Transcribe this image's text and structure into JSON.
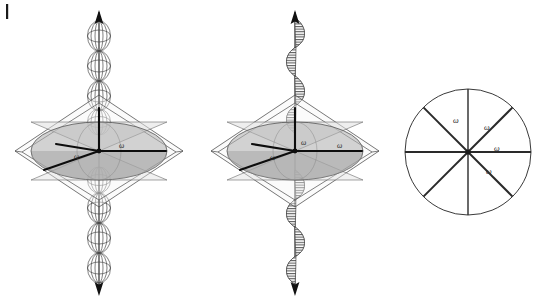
{
  "figure": {
    "background_color": "#ffffff",
    "width": 533,
    "height": 303,
    "margin_tick": {
      "name": "page-edge-tick",
      "x": 6,
      "y": 4,
      "width": 2,
      "height": 15,
      "color": "#1a1a1a"
    },
    "panels": [
      {
        "id": "panel-left",
        "name": "beaded-axis-panel",
        "center_x": 99,
        "center_y": 151,
        "axis_label_top": "",
        "axis_label_bottom": "",
        "wave_type": "bead-chain",
        "bead_count_top": 4,
        "bead_count_bottom": 4,
        "omega_labels": [
          {
            "text": "ω",
            "x": 74,
            "y": 156
          },
          {
            "text": "ω",
            "x": 119,
            "y": 146
          }
        ],
        "ellipse": {
          "cx": 99,
          "cy": 151,
          "rx": 68,
          "ry": 29,
          "fill": "#b8b8b8",
          "fill_opacity": 0.55,
          "stroke": "#555555"
        },
        "frame": {
          "stroke": "#4a4a4a",
          "fill": "#f2f2f2",
          "fill_opacity": 0.35
        },
        "vectors": [
          {
            "name": "vector-up",
            "x2": 99,
            "y2": 108
          },
          {
            "name": "vector-right",
            "x2": 166,
            "y2": 151
          },
          {
            "name": "vector-lower-left",
            "x2": 44,
            "y2": 170
          },
          {
            "name": "vector-mid-left",
            "x2": 55,
            "y2": 145
          }
        ]
      },
      {
        "id": "panel-middle",
        "name": "helix-axis-panel",
        "center_x": 295,
        "center_y": 151,
        "wave_type": "hatched-helix",
        "helix_periods_top": 3,
        "helix_periods_bottom": 3,
        "omega_labels": [
          {
            "text": "ω",
            "x": 270,
            "y": 157
          },
          {
            "text": "ω",
            "x": 301,
            "y": 143
          },
          {
            "text": "ω",
            "x": 337,
            "y": 146
          }
        ],
        "ellipse": {
          "cx": 295,
          "cy": 151,
          "rx": 68,
          "ry": 29,
          "fill": "#b8b8b8",
          "fill_opacity": 0.55,
          "stroke": "#555555"
        },
        "frame": {
          "stroke": "#4a4a4a",
          "fill": "#f2f2f2",
          "fill_opacity": 0.35
        },
        "vectors": [
          {
            "name": "vector-up",
            "x2": 295,
            "y2": 108
          },
          {
            "name": "vector-right",
            "x2": 362,
            "y2": 151
          },
          {
            "name": "vector-lower-left",
            "x2": 240,
            "y2": 170
          },
          {
            "name": "vector-mid-left",
            "x2": 252,
            "y2": 145
          }
        ]
      },
      {
        "id": "panel-right",
        "name": "sector-circle-panel",
        "circle": {
          "cx": 468,
          "cy": 152,
          "r": 63,
          "stroke": "#3a3a3a",
          "fill": "#ffffff",
          "stroke_width": 1
        },
        "spoke_count": 8,
        "spoke_angles_deg": [
          0,
          45,
          90,
          135,
          180,
          225,
          270,
          315
        ],
        "spoke_stroke": "#2a2a2a",
        "omega_labels": [
          {
            "text": "ω",
            "x": 456,
            "y": 120
          },
          {
            "text": "ω",
            "x": 487,
            "y": 127
          },
          {
            "text": "ω",
            "x": 497,
            "y": 148
          },
          {
            "text": "ω",
            "x": 489,
            "y": 171
          }
        ]
      }
    ],
    "colors": {
      "ink": "#2a2a2a",
      "frame_line": "#4a4a4a",
      "ellipse_fill": "#b8b8b8",
      "cone_fill": "#d8d8d8",
      "background": "#ffffff"
    }
  }
}
